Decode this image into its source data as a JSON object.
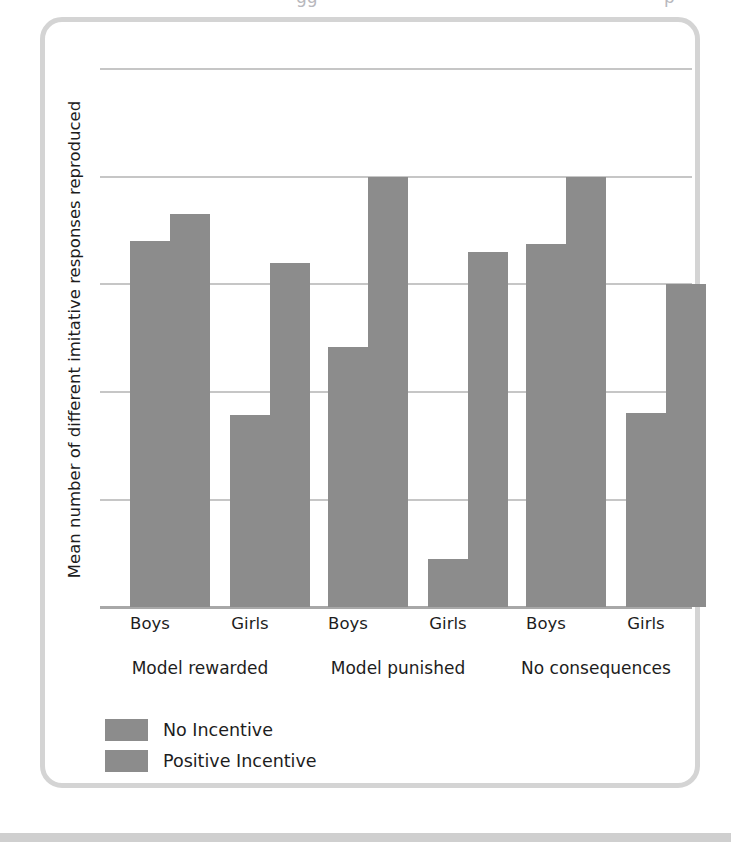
{
  "chart_data": {
    "type": "bar",
    "title": "",
    "subtitle": "",
    "xlabel": "",
    "ylabel": "Mean number of different imitative responses reproduced",
    "ylim": [
      0,
      5
    ],
    "yticks": [
      0,
      1,
      2,
      3,
      4,
      5
    ],
    "grid": true,
    "legend_position": "bottom-left",
    "groups": [
      "Model rewarded",
      "Model punished",
      "No consequences"
    ],
    "categories": [
      "Boys",
      "Girls",
      "Boys",
      "Girls",
      "Boys",
      "Girls"
    ],
    "series": [
      {
        "name": "No Incentive",
        "color": "#8c8c8c",
        "values": [
          3.4,
          1.78,
          2.42,
          0.45,
          3.37,
          1.8
        ]
      },
      {
        "name": "Positive Incentive",
        "color": "#8c8c8c",
        "values": [
          3.65,
          3.2,
          4.0,
          3.3,
          4.0,
          3.0
        ]
      }
    ],
    "bars": [
      {
        "group": "Model rewarded",
        "category": "Boys",
        "series": "No Incentive",
        "value": 3.4
      },
      {
        "group": "Model rewarded",
        "category": "Boys",
        "series": "Positive Incentive",
        "value": 3.65
      },
      {
        "group": "Model rewarded",
        "category": "Girls",
        "series": "No Incentive",
        "value": 1.78
      },
      {
        "group": "Model rewarded",
        "category": "Girls",
        "series": "Positive Incentive",
        "value": 3.2
      },
      {
        "group": "Model punished",
        "category": "Boys",
        "series": "No Incentive",
        "value": 2.42
      },
      {
        "group": "Model punished",
        "category": "Boys",
        "series": "Positive Incentive",
        "value": 4.0
      },
      {
        "group": "Model punished",
        "category": "Girls",
        "series": "No Incentive",
        "value": 0.45
      },
      {
        "group": "Model punished",
        "category": "Girls",
        "series": "Positive Incentive",
        "value": 3.3
      },
      {
        "group": "No consequences",
        "category": "Boys",
        "series": "No Incentive",
        "value": 3.37
      },
      {
        "group": "No consequences",
        "category": "Boys",
        "series": "Positive Incentive",
        "value": 4.0
      },
      {
        "group": "No consequences",
        "category": "Girls",
        "series": "No Incentive",
        "value": 1.8
      },
      {
        "group": "No consequences",
        "category": "Girls",
        "series": "Positive Incentive",
        "value": 3.0
      }
    ]
  },
  "axis": {
    "y_title": "Mean number of different imitative responses reproduced",
    "tick_5": "5",
    "tick_4": "4",
    "tick_3": "3",
    "tick_2": "2",
    "tick_1": "1",
    "tick_0": "0"
  },
  "categories": {
    "c0": "Boys",
    "c1": "Girls",
    "c2": "Boys",
    "c3": "Girls",
    "c4": "Boys",
    "c5": "Girls"
  },
  "groups": {
    "g0": "Model rewarded",
    "g1": "Model punished",
    "g2": "No consequences"
  },
  "legend": {
    "item_0": "No Incentive",
    "item_1": "Positive Incentive"
  },
  "colors": {
    "bar": "#8c8c8c",
    "gridline": "#c6c6c6",
    "axis": "#a8a8a8",
    "frame": "#d4d4d4",
    "band": "#cfcfcf",
    "text": "#1d1d1d"
  },
  "ghost": {
    "fragment_1": "gg",
    "fragment_2": "p"
  }
}
